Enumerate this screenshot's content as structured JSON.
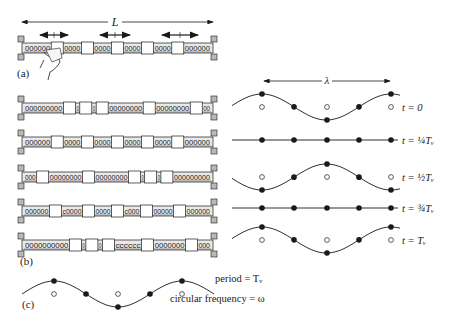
{
  "panels": {
    "a": {
      "label": "(a)",
      "length_label": "L",
      "rail": {
        "segments": [
          "coil",
          "mass",
          "coil",
          "mass",
          "coil",
          "mass",
          "coil",
          "mass",
          "coil",
          "mass",
          "coil"
        ],
        "coil_text": [
          "000000",
          "0000",
          "0000",
          "0000",
          "000000"
        ]
      },
      "arrow_count": 3
    },
    "b": {
      "label": "(b)",
      "rails": [
        {
          "coil_text": [
            "000000000",
            "0",
            "0",
            "00000000",
            "00000000",
            "00"
          ]
        },
        {
          "coil_text": [
            "000000",
            "0000",
            "0000",
            "0000",
            "0000",
            "000000"
          ]
        },
        {
          "coil_text": [
            "000",
            "00000000",
            "00000000",
            "0",
            "0",
            "000000000"
          ]
        },
        {
          "coil_text": [
            "000000",
            "c0000",
            "0000",
            "c000",
            "00000",
            "000000"
          ]
        },
        {
          "coil_text": [
            "0000000000",
            "0",
            "0",
            "cccccc",
            "0000000",
            "000"
          ]
        }
      ],
      "wavelength_label": "λ",
      "snapshots": [
        {
          "time_label": "t = 0",
          "phase": 0,
          "amplitude": 1
        },
        {
          "time_label": "t = ¼Tᵥ",
          "phase": 0.25,
          "amplitude": 0
        },
        {
          "time_label": "t = ½Tᵥ",
          "phase": 0.5,
          "amplitude": -1
        },
        {
          "time_label": "t = ¾Tᵥ",
          "phase": 0.75,
          "amplitude": 0
        },
        {
          "time_label": "t = Tᵥ",
          "phase": 1,
          "amplitude": 1
        }
      ]
    },
    "c": {
      "label": "(c)",
      "period_label": "period = Tᵥ",
      "freq_label": "circular frequency = ω"
    }
  },
  "colors": {
    "ink": "#1a1a1a",
    "rail_fill": "#e8e8e8",
    "end_block": "#b8b8b8"
  }
}
